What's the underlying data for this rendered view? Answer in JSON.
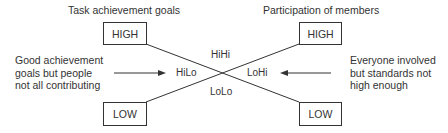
{
  "left_axis": {
    "title": "Task achievement goals",
    "high_label": "HIGH",
    "low_label": "LOW"
  },
  "right_axis": {
    "title": "Participation of members",
    "high_label": "HIGH",
    "low_label": "LOW"
  },
  "quadrants": {
    "top": "HiHi",
    "left": "HiLo",
    "right": "LoHi",
    "bottom": "LoLo"
  },
  "annotations": {
    "left": [
      "Good achievement",
      "goals but people",
      "not all contributing"
    ],
    "right": [
      "Everyone involved",
      "but standards not",
      "high enough"
    ]
  },
  "colors": {
    "line": "#333333",
    "text": "#333333",
    "background": "#ffffff"
  }
}
